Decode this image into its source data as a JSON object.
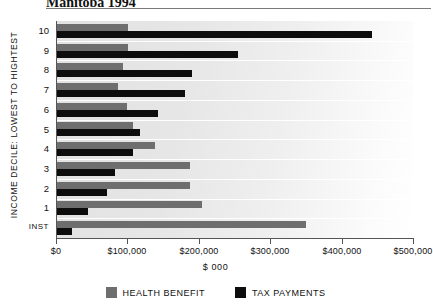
{
  "chart_data": {
    "type": "bar",
    "orientation": "horizontal",
    "title": "Manitoba 1994",
    "xlabel": "$ 000",
    "ylabel": "Income Decile: Lowest to Hightest",
    "xlim": [
      0,
      500000
    ],
    "xticks": [
      0,
      100000,
      200000,
      300000,
      400000,
      500000
    ],
    "xticklabels": [
      "$0",
      "$100,000",
      "$200,000",
      "$300,000",
      "$400,000",
      "$500,000"
    ],
    "grid": true,
    "legend_position": "bottom",
    "categories": [
      "10",
      "9",
      "8",
      "7",
      "6",
      "5",
      "4",
      "3",
      "2",
      "1",
      "Inst"
    ],
    "series": [
      {
        "name": "Health Benefit",
        "color": "#6e6e6e",
        "values": [
          101000,
          101000,
          94000,
          87000,
          100000,
          108000,
          139000,
          188000,
          188000,
          205000,
          350000
        ]
      },
      {
        "name": "Tax Payments",
        "color": "#0d0d0d",
        "values": [
          443000,
          255000,
          190000,
          181000,
          143000,
          117000,
          108000,
          83000,
          72000,
          45000,
          22000
        ]
      }
    ]
  },
  "legend": {
    "items": [
      {
        "label": "Health Benefit",
        "color": "#6e6e6e"
      },
      {
        "label": "Tax Payments",
        "color": "#0d0d0d"
      }
    ]
  }
}
